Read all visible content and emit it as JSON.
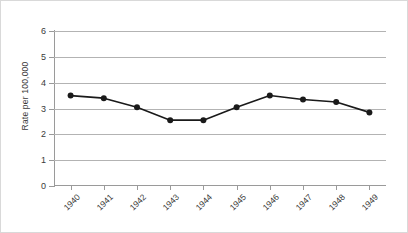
{
  "chart_data": {
    "type": "line",
    "title": "",
    "subtitle": "",
    "xlabel": "",
    "ylabel": "Rate per 100,000",
    "categories": [
      "1940",
      "1941",
      "1942",
      "1943",
      "1944",
      "1945",
      "1946",
      "1947",
      "1948",
      "1949"
    ],
    "values": [
      3.5,
      3.4,
      3.05,
      2.55,
      2.55,
      3.05,
      3.5,
      3.35,
      3.25,
      2.85
    ],
    "ylim": [
      0,
      6
    ],
    "yticks": [
      "0",
      "1",
      "2",
      "3",
      "4",
      "5",
      "6"
    ],
    "ytick_values": [
      0,
      1,
      2,
      3,
      4,
      5,
      6
    ],
    "grid": "horizontal",
    "legend": "none",
    "series_color": "#1a1a1a",
    "gridline_color": "#b3b3b3",
    "axis_color": "#9a9a9a",
    "marker": "circle",
    "xtick_rotation": "-45"
  }
}
